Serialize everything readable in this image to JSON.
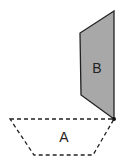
{
  "diagram": {
    "shapes": [
      {
        "id": "B",
        "label": "B",
        "style": "solid",
        "fill": "#a8a8a8",
        "stroke": "#222222",
        "points": "114,11 80,33 81,95 114,119"
      },
      {
        "id": "A",
        "label": "A",
        "style": "dashed",
        "fill": "none",
        "stroke": "#222222",
        "points": "10,119 114,119 93,155 34,155"
      }
    ],
    "pivot_point": {
      "x": 114,
      "y": 119,
      "color": "#111111"
    }
  }
}
